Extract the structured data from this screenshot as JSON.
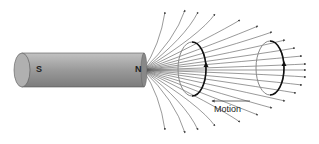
{
  "diagram": {
    "magnet": {
      "south_label": "S",
      "north_label": "N",
      "body_color": "#9a9a9a"
    },
    "loops": [
      {
        "position": "near",
        "arrow": "up"
      },
      {
        "position": "far",
        "arrow": "up"
      }
    ],
    "motion_label": "Motion",
    "line_color": "#555555"
  }
}
